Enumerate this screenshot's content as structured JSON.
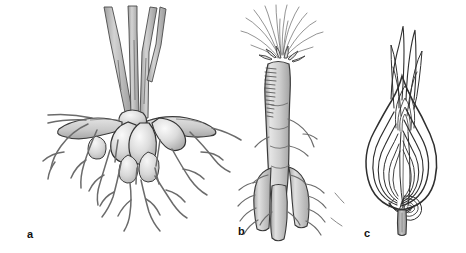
{
  "figure": {
    "background_color": "#ffffff",
    "width": 466,
    "height": 253,
    "style": "grayscale line art botanical illustration"
  },
  "palette": {
    "ink": "#2b2b2b",
    "ink_light": "#6d6d6d",
    "fill_light": "#e9e9e9",
    "fill_mid": "#cfcfcf",
    "fill_dark": "#b3b3b3",
    "highlight": "#f6f6f6",
    "stem_gray": "#b8b8b8",
    "background": "#ffffff"
  },
  "panels": [
    {
      "id": "a",
      "label": "a",
      "label_x": 27,
      "label_y": 229,
      "subject": "tuberous-root-cluster",
      "description": "Cluster of swollen tuberous roots attached below several upright stems, with spreading fibrous lateral roots",
      "parts": [
        "stems",
        "crown",
        "tubers",
        "lateral-roots",
        "fine-rootlets"
      ],
      "tuber_count": 7,
      "stem_count": 4
    },
    {
      "id": "b",
      "label": "b",
      "label_x": 238,
      "label_y": 226,
      "subject": "taproot",
      "description": "Single thick taproot with a tuft of cut leaf bases at the crown, transverse hatch marks on the shoulder, and three stout root branches with fine laterals at the base",
      "parts": [
        "leaf-tuft",
        "crown",
        "taproot-body",
        "root-branches",
        "lateral-rootlets"
      ],
      "branch_count": 3
    },
    {
      "id": "c",
      "label": "c",
      "label_x": 364,
      "label_y": 228,
      "subject": "bulb-longitudinal-section",
      "description": "Bulb cut lengthwise showing concentric fleshy scales, a central shoot of nested pointed leaves, a lateral offset bulblet and the basal plate with a short stem",
      "parts": [
        "foliage-leaves",
        "bulb-scales",
        "central-shoot",
        "offset-bulblet",
        "basal-plate",
        "stem-stub"
      ],
      "scale_layers": 6
    }
  ]
}
